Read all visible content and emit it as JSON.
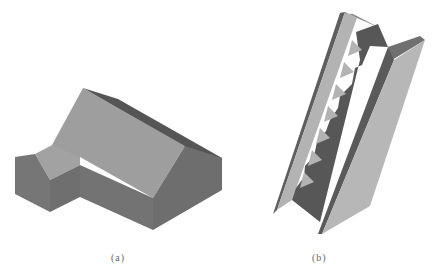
{
  "figure": {
    "panels": [
      {
        "id": "a",
        "caption": "(a)",
        "description": "3D shaded model of an L-shaped building with gabled roof"
      },
      {
        "id": "b",
        "caption": "(b)",
        "description": "3D shaded model of a straight staircase with side stringers"
      }
    ],
    "colors": {
      "background": "#ffffff",
      "light_face": "#9d9d9d",
      "mid_face": "#7a7a7a",
      "dark_face": "#5a5a5a",
      "panel_light": "#b5b5b5"
    }
  }
}
